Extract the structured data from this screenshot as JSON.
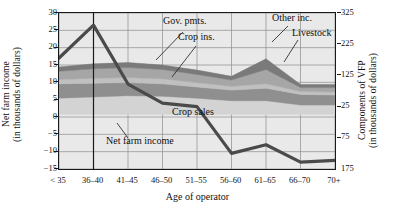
{
  "chart_data": {
    "type": "area",
    "title": "",
    "xlabel": "Age of operator",
    "ylabel_left": "Net farm income\n(in thousands of dollars)",
    "ylabel_right": "Components of VFP\n(in thousands of dollars)",
    "categories": [
      "< 35",
      "36–40",
      "41–45",
      "46–50",
      "51–55",
      "56–60",
      "61–65",
      "66–70",
      "70+"
    ],
    "yticks_left": [
      "30",
      "25",
      "20",
      "15",
      "10",
      "5",
      "0",
      "−5",
      "−10",
      "−15"
    ],
    "ylim_left": [
      -15,
      30
    ],
    "yticks_right": [
      "325",
      "225",
      "125",
      "25",
      "75",
      "175"
    ],
    "ylim_right": [
      -175,
      325
    ],
    "grid": true,
    "legend_position": "inline-annotations",
    "annotations": [
      {
        "name": "gov-pmts",
        "label": "Gov. pmts."
      },
      {
        "name": "crop-ins",
        "label": "Crop ins."
      },
      {
        "name": "other-inc",
        "label": "Other inc."
      },
      {
        "name": "livestock",
        "label": "Livestock"
      },
      {
        "name": "crop-sales",
        "label": "Crop sales"
      },
      {
        "name": "net-farm-income",
        "label": "Net farm income"
      }
    ],
    "reference_line": {
      "at_category": "36–40",
      "orientation": "vertical"
    },
    "series": [
      {
        "name": "Crop sales",
        "axis": "right",
        "color": "#d3d3d3",
        "values": [
          52,
          56,
          60,
          58,
          52,
          44,
          44,
          30,
          30
        ]
      },
      {
        "name": "Livestock",
        "axis": "right",
        "color": "#8f8f8f",
        "values": [
          46,
          44,
          42,
          40,
          36,
          34,
          40,
          34,
          32
        ]
      },
      {
        "name": "Crop ins.",
        "axis": "right",
        "color": "#c0c0c0",
        "values": [
          14,
          16,
          16,
          16,
          14,
          12,
          14,
          10,
          10
        ]
      },
      {
        "name": "Gov. pmts.",
        "axis": "right",
        "color": "#a6a6a6",
        "values": [
          26,
          30,
          32,
          30,
          26,
          20,
          46,
          12,
          14
        ]
      },
      {
        "name": "Other inc.",
        "axis": "right",
        "color": "#7a7a7a",
        "values": [
          14,
          16,
          16,
          14,
          14,
          12,
          34,
          10,
          10
        ]
      }
    ],
    "line_series": {
      "name": "Net farm income",
      "axis": "left",
      "color": "#4a4a4a",
      "values": [
        17.0,
        26.5,
        9.5,
        4.0,
        3.0,
        -10.5,
        -8.0,
        -13.0,
        -12.5
      ]
    }
  }
}
